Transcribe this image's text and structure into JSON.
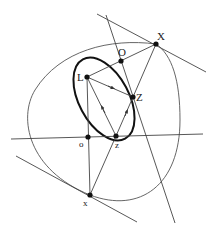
{
  "diagram": {
    "title": "",
    "colors": {
      "line": "#444444",
      "thin_curve": "#555555",
      "bold_ellipse": "#111111",
      "point": "#111111",
      "text": "#222222"
    },
    "points": [
      {
        "id": "X_upper",
        "label": "X",
        "x": 156,
        "y": 44,
        "label_x": 157,
        "label_y": 39,
        "size": 10
      },
      {
        "id": "O_upper",
        "label": "O",
        "x": 121,
        "y": 61,
        "label_x": 118,
        "label_y": 56,
        "size": 10
      },
      {
        "id": "L",
        "label": "L",
        "x": 87,
        "y": 77,
        "label_x": 76,
        "label_y": 81,
        "size": 10
      },
      {
        "id": "Z_mid",
        "label": "Z",
        "x": 133,
        "y": 97,
        "label_x": 135,
        "label_y": 101,
        "size": 10
      },
      {
        "id": "o_lower",
        "label": "o",
        "x": 88,
        "y": 137,
        "label_x": 79,
        "label_y": 147,
        "size": 8
      },
      {
        "id": "z_lower",
        "label": "z",
        "x": 116,
        "y": 136,
        "label_x": 115,
        "label_y": 147,
        "size": 8
      },
      {
        "id": "x_lower",
        "label": "x",
        "x": 90,
        "y": 195,
        "label_x": 83,
        "label_y": 205,
        "size": 8
      }
    ],
    "labels": {
      "X_upper": "X",
      "O_upper": "O",
      "L": "L",
      "Z_mid": "Z",
      "o_lower": "o",
      "z_lower": "z",
      "x_lower": "x"
    }
  }
}
